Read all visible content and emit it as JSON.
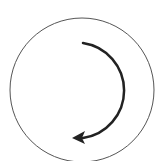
{
  "diagram": {
    "icon": "clockwise-rotation-icon",
    "colors": {
      "background": "#ffffff",
      "circle_stroke": "#555555",
      "arrow_stroke": "#222222"
    }
  }
}
